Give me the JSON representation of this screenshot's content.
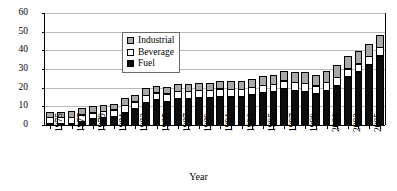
{
  "chart_data": {
    "type": "bar",
    "subtype": "stacked-bar",
    "title": "",
    "xlabel": "Year",
    "ylabel": "Billion liters",
    "ylim": [
      0,
      60
    ],
    "yticks": [
      0,
      10,
      20,
      30,
      40,
      50,
      60
    ],
    "grid": true,
    "legend_position": "upper-left-inside",
    "categories": [
      "1975",
      "1976",
      "1977",
      "1978",
      "1979",
      "1980",
      "1981",
      "1982",
      "1983",
      "1984",
      "1985",
      "1986",
      "1987",
      "1988",
      "1989",
      "1990",
      "1991",
      "1992",
      "1993",
      "1994",
      "1995",
      "1996",
      "1997",
      "1998",
      "1999",
      "2000",
      "2001",
      "2002",
      "2003",
      "2004",
      "2005",
      "2006"
    ],
    "xtick_labels": [
      "1975",
      "1977",
      "1979",
      "1981",
      "1983",
      "1985",
      "1987",
      "1989",
      "1991",
      "1993",
      "1995",
      "1997",
      "1999",
      "2001",
      "2003",
      "2005"
    ],
    "xtick_interval_years": 2,
    "series": [
      {
        "name": "Fuel",
        "color": "#0d0d0d",
        "values": [
          0.6,
          0.7,
          1.4,
          2.4,
          3.6,
          4.4,
          5.0,
          7.0,
          9.1,
          12.4,
          13.9,
          13.2,
          14.5,
          14.6,
          15.0,
          14.9,
          15.8,
          15.5,
          15.4,
          16.6,
          17.9,
          18.2,
          20.0,
          19.1,
          18.5,
          17.1,
          19.0,
          21.7,
          26.1,
          28.9,
          32.8,
          37.5
        ]
      },
      {
        "name": "Beverage",
        "color": "#ffffff",
        "values": [
          3.9,
          3.7,
          3.5,
          3.7,
          3.6,
          3.7,
          3.8,
          4.2,
          4.1,
          4.1,
          4.0,
          4.2,
          4.1,
          4.2,
          4.2,
          4.3,
          4.3,
          4.3,
          4.3,
          4.2,
          4.2,
          4.3,
          4.3,
          4.4,
          4.4,
          4.5,
          4.5,
          4.5,
          4.6,
          4.6,
          4.7,
          4.7
        ]
      },
      {
        "name": "Industrial",
        "color": "#a8a8a8",
        "values": [
          2.8,
          3.0,
          3.5,
          3.8,
          3.8,
          3.6,
          3.6,
          4.1,
          4.1,
          4.3,
          4.2,
          4.0,
          4.3,
          4.4,
          4.5,
          4.4,
          4.4,
          4.5,
          4.6,
          4.7,
          4.9,
          5.0,
          5.7,
          5.9,
          6.2,
          6.3,
          6.6,
          6.9,
          7.3,
          7.2,
          6.7,
          6.9
        ]
      }
    ],
    "totals": [
      7.3,
      7.4,
      8.4,
      9.9,
      11.0,
      11.7,
      12.4,
      15.3,
      17.3,
      20.8,
      22.1,
      21.4,
      22.9,
      23.2,
      23.7,
      23.6,
      24.5,
      24.3,
      24.3,
      25.5,
      27.0,
      27.5,
      30.0,
      29.4,
      29.1,
      27.9,
      30.1,
      33.1,
      38.0,
      40.7,
      44.2,
      49.1
    ]
  },
  "legend": {
    "items": [
      {
        "label": "Industrial"
      },
      {
        "label": "Beverage"
      },
      {
        "label": "Fuel"
      }
    ]
  }
}
